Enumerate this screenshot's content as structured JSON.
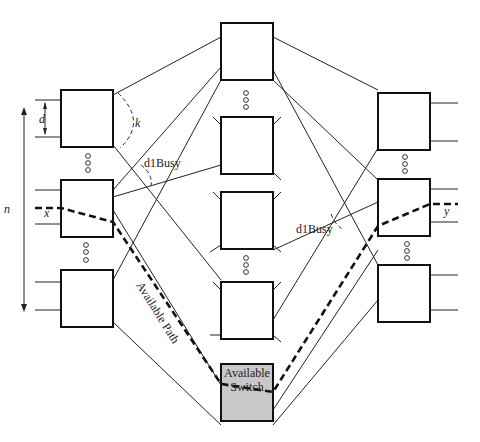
{
  "diagram": {
    "labels": {
      "d": "d",
      "k": "k",
      "n": "n",
      "x": "x",
      "y": "y",
      "d1busy_left": "d1Busy",
      "d1busy_right": "d1Busy",
      "available_path": "Available Path",
      "available_switch_line1": "Available",
      "available_switch_line2": "Switch"
    },
    "stages": [
      {
        "name": "input-stage",
        "switches": 3
      },
      {
        "name": "middle-stage",
        "switches": 5,
        "highlighted": "Available Switch"
      },
      {
        "name": "output-stage",
        "switches": 3
      }
    ],
    "colors": {
      "line": "#222222",
      "available_switch_fill": "#c8c8c8",
      "background": "#ffffff"
    },
    "caption": ""
  }
}
